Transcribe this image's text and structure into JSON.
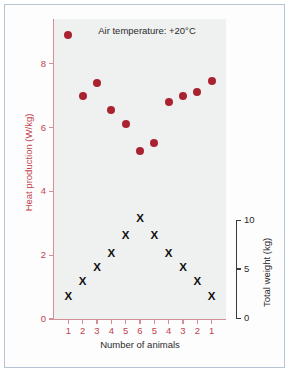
{
  "chart_data": {
    "type": "scatter",
    "title": "Air temperature: +20°C",
    "xlabel": "Number of animals",
    "ylabel": "Heat production (W/kg)",
    "ylabel_secondary": "Total weight (kg)",
    "x_categories": [
      "1",
      "2",
      "3",
      "4",
      "5",
      "6",
      "5",
      "4",
      "3",
      "2",
      "1"
    ],
    "ylim": [
      0,
      9.4
    ],
    "yticks": [
      "0",
      "2",
      "4",
      "6",
      "8"
    ],
    "ytick_values": [
      0,
      2,
      4,
      6,
      8
    ],
    "ylim_secondary": [
      0,
      11.6
    ],
    "yticks_secondary": [
      "0",
      "5",
      "10"
    ],
    "ytick_values_secondary": [
      0,
      5,
      10
    ],
    "grid": false,
    "legend": "none",
    "series": [
      {
        "name": "Heat production (W/kg)",
        "axis": "left",
        "marker": "circle",
        "color": "#a8222f",
        "values": [
          8.9,
          7.0,
          7.4,
          6.55,
          6.1,
          5.25,
          5.5,
          6.8,
          7.0,
          7.1,
          7.45
        ]
      },
      {
        "name": "Total weight (kg)",
        "axis": "right",
        "marker": "x",
        "color": "#111111",
        "values": [
          2.2,
          3.8,
          5.2,
          6.6,
          8.5,
          10.2,
          8.5,
          6.6,
          5.2,
          3.8,
          2.2
        ]
      }
    ]
  },
  "figure": {
    "title": "Air temperature: +20°C",
    "x_axis_label": "Number of animals",
    "y_axis_left_label": "Heat production (W/kg)",
    "y_axis_right_label": "Total weight (kg)",
    "accent_color": "#a8222f",
    "axis_color": "#c0434f",
    "panel_color": "#eff0f0"
  }
}
